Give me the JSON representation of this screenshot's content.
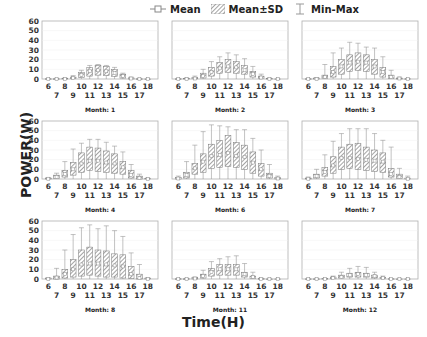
{
  "chart_data": {
    "type": "bar",
    "layout": "3x3 grid of box-style bar panels",
    "xlabel": "Time(H)",
    "ylabel": "POWER(W)",
    "ylim": [
      0,
      60
    ],
    "yticks": [
      0,
      10,
      20,
      30,
      40,
      50,
      60
    ],
    "x": [
      6,
      7,
      8,
      9,
      10,
      11,
      12,
      13,
      14,
      15,
      16,
      17,
      18
    ],
    "legend": {
      "position": "top-center",
      "entries": [
        "Mean",
        "Mean±SD",
        "Min-Max"
      ]
    },
    "colors": {
      "frame": "#b0b0b0",
      "hatch": "#555555",
      "whisker": "#999999",
      "mean_marker": "#888888"
    },
    "panels": [
      {
        "title": "Month: 1",
        "mean": [
          0,
          0,
          0.2,
          1,
          4,
          8,
          9,
          8,
          6,
          3,
          0.5,
          0,
          0
        ],
        "sd_low": [
          0,
          0,
          0,
          0.3,
          1.5,
          3,
          4,
          3.5,
          2.5,
          1,
          0,
          0,
          0
        ],
        "sd_high": [
          0.2,
          0.2,
          0.8,
          2,
          7,
          12,
          14,
          13,
          10,
          5,
          1.2,
          0.2,
          0
        ],
        "min": [
          0,
          0,
          0,
          0,
          0,
          0,
          0,
          0,
          0,
          0,
          0,
          0,
          0
        ],
        "max": [
          0.3,
          0.3,
          1,
          3.5,
          9,
          14,
          15,
          14,
          12,
          6,
          2,
          0.3,
          0
        ]
      },
      {
        "title": "Month: 2",
        "mean": [
          0,
          0,
          0.5,
          3,
          7,
          11,
          13,
          12,
          9,
          5,
          1.5,
          0.2,
          0
        ],
        "sd_low": [
          0,
          0,
          0.2,
          1,
          3,
          6,
          7,
          6,
          5,
          2,
          0.5,
          0,
          0
        ],
        "sd_high": [
          0.2,
          0.5,
          1.5,
          6,
          12,
          17,
          20,
          18,
          14,
          8,
          3,
          0.5,
          0
        ],
        "min": [
          0,
          0,
          0,
          0,
          0,
          0,
          0,
          0,
          0,
          0,
          0,
          0,
          0
        ],
        "max": [
          0.3,
          1,
          3,
          10,
          18,
          23,
          27,
          25,
          21,
          13,
          5,
          1,
          0
        ]
      },
      {
        "title": "Month: 3",
        "mean": [
          0,
          0.2,
          2,
          7,
          13,
          17,
          18,
          17,
          13,
          7,
          2,
          0.5,
          0
        ],
        "sd_low": [
          0,
          0,
          0.5,
          2,
          5,
          8,
          9,
          8,
          5,
          2,
          0.5,
          0,
          0
        ],
        "sd_high": [
          0.2,
          1,
          4,
          13,
          20,
          25,
          27,
          25,
          20,
          12,
          4,
          1,
          0.2
        ],
        "min": [
          0,
          0,
          0,
          0,
          0,
          0,
          0,
          0,
          0,
          0,
          0,
          0,
          0
        ],
        "max": [
          0.5,
          1.5,
          15,
          27,
          32,
          38,
          37,
          33,
          32,
          23,
          9,
          2,
          0.5
        ]
      },
      {
        "title": "Month: 4",
        "mean": [
          0.3,
          2,
          5,
          10,
          16,
          19,
          19,
          17,
          16,
          12,
          4,
          1,
          0.2
        ],
        "sd_low": [
          0,
          0.5,
          2,
          4,
          7,
          9,
          8,
          7,
          6,
          5,
          1,
          0,
          0
        ],
        "sd_high": [
          1,
          4,
          9,
          17,
          27,
          33,
          32,
          29,
          26,
          18,
          9,
          3,
          0.5
        ],
        "min": [
          0,
          0,
          0,
          0,
          0,
          0,
          0,
          0,
          0,
          0,
          0,
          0,
          0
        ],
        "max": [
          1.5,
          6,
          18,
          31,
          37,
          41,
          41,
          38,
          34,
          28,
          15,
          5,
          1
        ]
      },
      {
        "title": "Month: 6",
        "mean": [
          0.5,
          4,
          11,
          18,
          24,
          25,
          27,
          24,
          23,
          17,
          10,
          3,
          0.5
        ],
        "sd_low": [
          0,
          1,
          5,
          7,
          11,
          12,
          13,
          12,
          10,
          6,
          3,
          1,
          0
        ],
        "sd_high": [
          1.5,
          7,
          16,
          26,
          36,
          40,
          45,
          38,
          35,
          28,
          16,
          6,
          1.5
        ],
        "min": [
          0,
          0,
          0,
          0,
          0,
          0,
          0,
          0,
          0,
          0,
          0,
          0,
          0
        ],
        "max": [
          3,
          18,
          35,
          49,
          56,
          55,
          54,
          51,
          51,
          42,
          30,
          15,
          3
        ]
      },
      {
        "title": "Month: 7",
        "mean": [
          0.3,
          3,
          7,
          14,
          22,
          22,
          21,
          20,
          19,
          18,
          5,
          2,
          0.3
        ],
        "sd_low": [
          0,
          1,
          3,
          6,
          10,
          11,
          10,
          9,
          8,
          7,
          2,
          0.5,
          0
        ],
        "sd_high": [
          1,
          5,
          12,
          23,
          33,
          36,
          37,
          33,
          30,
          27,
          11,
          5,
          1
        ],
        "min": [
          0,
          0,
          0,
          0,
          0,
          0,
          0,
          0,
          0,
          0,
          0,
          0,
          0
        ],
        "max": [
          2,
          10,
          25,
          39,
          47,
          52,
          52,
          52,
          47,
          40,
          33,
          11,
          3
        ]
      },
      {
        "title": "Month: 8",
        "mean": [
          0.2,
          1.5,
          5,
          10,
          15,
          16,
          16,
          15,
          14,
          13,
          5,
          1,
          0.2
        ],
        "sd_low": [
          0,
          0,
          1,
          2,
          3,
          4,
          3,
          2,
          2,
          1,
          0.5,
          0,
          0
        ],
        "sd_high": [
          1,
          3,
          10,
          20,
          30,
          33,
          30,
          29,
          26,
          25,
          13,
          5,
          1
        ],
        "min": [
          0,
          0,
          0,
          0,
          0,
          0,
          0,
          0,
          0,
          0,
          0,
          0,
          0
        ],
        "max": [
          1,
          11,
          30,
          46,
          53,
          56,
          52,
          55,
          50,
          44,
          27,
          15,
          1
        ]
      },
      {
        "title": "Month: 11",
        "mean": [
          0,
          0,
          0.5,
          3,
          7,
          10,
          10,
          10,
          5,
          2,
          0,
          0,
          0
        ],
        "sd_low": [
          0,
          0,
          0,
          1,
          3,
          4,
          4,
          4,
          2,
          0.5,
          0,
          0,
          0
        ],
        "sd_high": [
          0.2,
          0.2,
          1.5,
          5,
          11,
          15,
          15,
          15,
          7,
          3,
          0.3,
          0,
          0
        ],
        "min": [
          0,
          0,
          0,
          0,
          0,
          0,
          0,
          0,
          0,
          0,
          0,
          0,
          0
        ],
        "max": [
          0.3,
          0.5,
          2,
          9,
          18,
          21,
          23,
          24,
          16,
          7,
          1,
          0,
          0
        ]
      },
      {
        "title": "Month: 12",
        "mean": [
          0,
          0,
          0.1,
          0.8,
          2,
          4,
          5,
          4,
          3,
          1,
          0,
          0,
          0
        ],
        "sd_low": [
          0,
          0,
          0,
          0.2,
          1,
          2,
          2,
          2,
          1,
          0.3,
          0,
          0,
          0
        ],
        "sd_high": [
          0.1,
          0.1,
          0.4,
          2,
          4,
          6,
          7,
          6,
          4,
          1.5,
          0.2,
          0,
          0
        ],
        "min": [
          0,
          0,
          0,
          0,
          0,
          0,
          0,
          0,
          0,
          0,
          0,
          0,
          0
        ],
        "max": [
          0.2,
          0.2,
          0.6,
          3,
          7,
          11,
          13,
          12,
          7,
          3,
          0.5,
          0,
          0
        ]
      }
    ]
  }
}
